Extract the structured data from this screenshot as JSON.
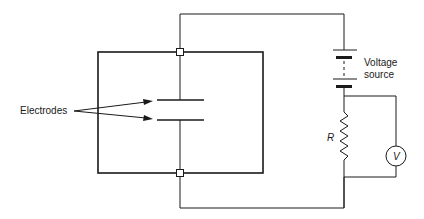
{
  "diagram": {
    "type": "circuit",
    "labels": {
      "electrodes": "Electrodes",
      "voltage_source_line1": "Voltage",
      "voltage_source_line2": "source",
      "resistor": "R",
      "voltmeter": "V"
    },
    "components": [
      {
        "id": "enclosure",
        "kind": "box"
      },
      {
        "id": "electrodes",
        "kind": "parallel-plate-capacitor"
      },
      {
        "id": "voltage-source",
        "kind": "battery"
      },
      {
        "id": "resistor",
        "kind": "resistor",
        "label": "R"
      },
      {
        "id": "voltmeter",
        "kind": "voltmeter",
        "label": "V"
      }
    ],
    "colors": {
      "line": "#1a1a1a",
      "background": "#ffffff"
    }
  }
}
